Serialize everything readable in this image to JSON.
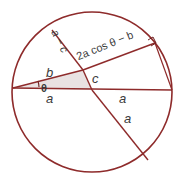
{
  "figure": {
    "type": "geometry-diagram",
    "colors": {
      "stroke": "#8e2b2b",
      "circle_stroke": "#8e2b2b",
      "shade_fill": "#e9e2e2",
      "label_text": "#3b3b3b",
      "background": "#ffffff"
    },
    "circle": {
      "cx": 92,
      "cy": 92,
      "r": 80,
      "stroke_width": 1.6
    },
    "points": {
      "left_vertex": {
        "x": 13,
        "y": 88
      },
      "right_vertex": {
        "x": 172,
        "y": 90
      },
      "upper_left_chord_end": {
        "x": 52,
        "y": 30
      },
      "upper_right_chord_end": {
        "x": 155,
        "y": 43
      },
      "lower_right_chord_end": {
        "x": 148,
        "y": 160
      },
      "chord_intersection": {
        "x": 88,
        "y": 88
      },
      "upper_intersection": {
        "x": 83,
        "y": 70
      }
    },
    "right_angle_marker": {
      "x": 152,
      "y": 42,
      "size": 6
    },
    "angle_arc": {
      "label": "θ",
      "center": {
        "x": 13,
        "y": 88
      },
      "radius": 26
    },
    "labels": [
      {
        "name": "a-left",
        "text": "a",
        "role": "segment-length"
      },
      {
        "name": "a-right",
        "text": "a",
        "role": "segment-length"
      },
      {
        "name": "a-diagonal",
        "text": "a",
        "role": "segment-length"
      },
      {
        "name": "b",
        "text": "b",
        "role": "segment-length"
      },
      {
        "name": "c",
        "text": "c",
        "role": "segment-length"
      },
      {
        "name": "a-minus-c",
        "text": "a − c",
        "role": "segment-length"
      },
      {
        "name": "two-a-cos-b",
        "text": "2a cos θ − b",
        "role": "segment-length"
      },
      {
        "name": "theta",
        "text": "θ",
        "role": "angle"
      }
    ],
    "label_text": {
      "a_left": "a",
      "a_right": "a",
      "a_diagonal": "a",
      "b": "b",
      "c": "c",
      "a_minus_c": "a − c",
      "two_a_cos_prefix": "2",
      "two_a_cos_a": "a",
      "two_a_cos_mid": " cos ",
      "two_a_cos_theta": "θ",
      "two_a_cos_suffix": " − ",
      "two_a_cos_b": "b",
      "two_a_cos_full": "2a cos θ − b",
      "theta": "θ"
    }
  }
}
